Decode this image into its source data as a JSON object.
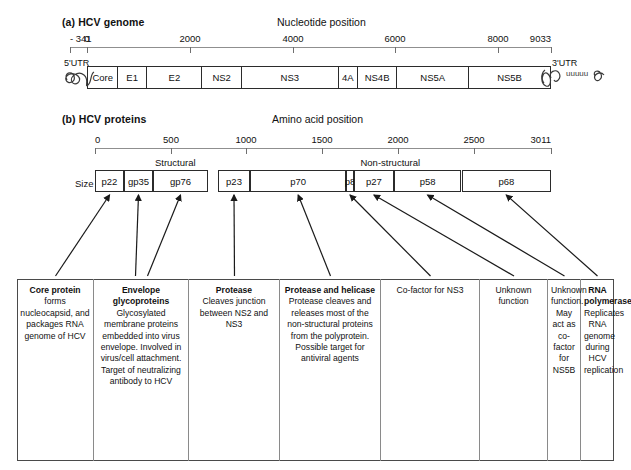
{
  "figure": {
    "panel_a": {
      "caption": "(a) HCV genome",
      "axis_caption": "Nucleotide position",
      "axis_ticks": [
        {
          "label": "- 341",
          "value": -341
        },
        {
          "label": "0",
          "value": 0
        },
        {
          "label": "2000",
          "value": 2000
        },
        {
          "label": "4000",
          "value": 4000
        },
        {
          "label": "6000",
          "value": 6000
        },
        {
          "label": "8000",
          "value": 8000
        },
        {
          "label": "9033",
          "value": 9033
        }
      ],
      "axis_min": -341,
      "axis_max": 9033,
      "utr_left_label": "5'UTR",
      "utr_right_label": "3'UTR",
      "poly_a_label": "uuuuu",
      "segments": [
        {
          "label": "Core",
          "start": 0,
          "end": 573
        },
        {
          "label": "E1",
          "start": 573,
          "end": 1149
        },
        {
          "label": "E2",
          "start": 1149,
          "end": 2220
        },
        {
          "label": "NS2",
          "start": 2220,
          "end": 2990
        },
        {
          "label": "NS3",
          "start": 2990,
          "end": 4880
        },
        {
          "label": "4A",
          "start": 4880,
          "end": 5250
        },
        {
          "label": "NS4B",
          "start": 5250,
          "end": 6020
        },
        {
          "label": "NS5A",
          "start": 6020,
          "end": 7420
        },
        {
          "label": "NS5B",
          "start": 7420,
          "end": 9033
        }
      ]
    },
    "panel_b": {
      "caption": "(b) HCV proteins",
      "axis_caption": "Amino acid position",
      "axis_ticks": [
        {
          "label": "0",
          "value": 0
        },
        {
          "label": "500",
          "value": 500
        },
        {
          "label": "1000",
          "value": 1000
        },
        {
          "label": "1500",
          "value": 1500
        },
        {
          "label": "2000",
          "value": 2000
        },
        {
          "label": "2500",
          "value": 2500
        },
        {
          "label": "3011",
          "value": 3011
        }
      ],
      "axis_min": 0,
      "axis_max": 3011,
      "size_label": "Size",
      "group_labels": [
        {
          "label": "Structural",
          "center": 530
        },
        {
          "label": "Non-structural",
          "center": 1950
        }
      ],
      "proteins": [
        {
          "label": "p22",
          "start": 0,
          "end": 191
        },
        {
          "label": "gp35",
          "start": 191,
          "end": 383
        },
        {
          "label": "gp76",
          "start": 383,
          "end": 746
        },
        {
          "label": "p23",
          "start": 810,
          "end": 1026
        },
        {
          "label": "p70",
          "start": 1026,
          "end": 1657
        },
        {
          "label": "p8",
          "start": 1658,
          "end": 1711
        },
        {
          "label": "p27",
          "start": 1712,
          "end": 1972
        },
        {
          "label": "p58",
          "start": 1973,
          "end": 2420
        },
        {
          "label": "p68",
          "start": 2421,
          "end": 3011
        }
      ]
    },
    "descriptions": [
      {
        "head": "Core protein",
        "body": "forms nucleocapsid, and packages RNA genome of HCV"
      },
      {
        "head": "Envelope glycoproteins",
        "body": "Glycosylated membrane proteins embedded into virus envelope. Involved in virus/cell attachment. Target of neutralizing antibody to HCV"
      },
      {
        "head": "Protease",
        "body": "Cleaves junction between NS2 and NS3"
      },
      {
        "head": "Protease and helicase",
        "body": "Protease cleaves and releases most of the non-structural proteins from the polyprotein. Possible target for antiviral agents"
      },
      {
        "head": "",
        "body": "Co-factor for NS3"
      },
      {
        "head": "",
        "body": "Unknown function"
      },
      {
        "head": "",
        "body": "Unknown function. May act as co-factor for NS5B"
      },
      {
        "head": "RNA polymerase",
        "body": "Replicates RNA genome during HCV replication"
      }
    ],
    "colors": {
      "ink": "#111111",
      "box_border": "#2b2b2b",
      "axis": "#8f8f8f",
      "desc_border": "#4a4a4a"
    }
  }
}
